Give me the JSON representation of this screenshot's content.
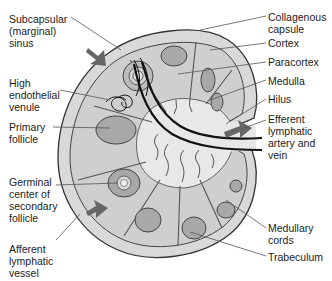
{
  "diagram": {
    "colors": {
      "capsule": "#d9d9d9",
      "outline": "#333333",
      "cortex": "#cfcfcf",
      "follicle": "#a8a8a8",
      "medulla": "#e6e6e6",
      "vessel": "#111111",
      "arrow": "#666666"
    },
    "labels_left": [
      {
        "id": "subcapsular-sinus",
        "text": "Subcapsular\n(marginal)\nsinus"
      },
      {
        "id": "high-endothelial-venule",
        "text": "High\nendothelial\nvenule"
      },
      {
        "id": "primary-follicle",
        "text": "Primary\nfollicle"
      },
      {
        "id": "germinal-center",
        "text": "Germinal\ncenter of\nsecondary\nfollicle"
      },
      {
        "id": "afferent-lymphatic",
        "text": "Afferent\nlymphatic\nvessel"
      }
    ],
    "labels_right": [
      {
        "id": "collagenous-capsule",
        "text": "Collagenous\ncapsule"
      },
      {
        "id": "cortex",
        "text": "Cortex"
      },
      {
        "id": "paracortex",
        "text": "Paracortex"
      },
      {
        "id": "medulla",
        "text": "Medulla"
      },
      {
        "id": "hilus",
        "text": "Hilus"
      },
      {
        "id": "efferent-lymphatic",
        "text": "Efferent\nlymphatic\nartery and\nvein"
      },
      {
        "id": "medullary-cords",
        "text": "Medullary\ncords"
      },
      {
        "id": "trabeculum",
        "text": "Trabeculum"
      }
    ]
  }
}
